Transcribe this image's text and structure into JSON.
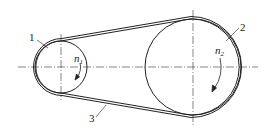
{
  "diagram": {
    "type": "belt-drive",
    "labels": {
      "small_pulley": "1",
      "large_pulley": "2",
      "belt": "3",
      "speed_small": "n",
      "speed_small_sub": "1",
      "speed_large": "n",
      "speed_large_sub": "2"
    },
    "colors": {
      "line": "#222222",
      "background": "#ffffff"
    }
  }
}
